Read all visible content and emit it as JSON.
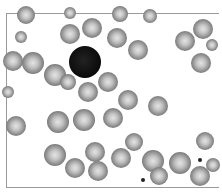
{
  "image": {
    "subject": "blood smear micrograph",
    "palette": {
      "background": "#ffffff",
      "cell_rim": "#6a6a6a",
      "cell_center": "#e4e4e4",
      "nucleus": "#0a0a0a",
      "frame": "#9a9a9a"
    }
  },
  "cells": [
    {
      "x": 26,
      "y": 15,
      "r": 9
    },
    {
      "x": 70,
      "y": 13,
      "r": 6
    },
    {
      "x": 92,
      "y": 28,
      "r": 10
    },
    {
      "x": 120,
      "y": 14,
      "r": 8
    },
    {
      "x": 150,
      "y": 16,
      "r": 7
    },
    {
      "x": 21,
      "y": 37,
      "r": 6
    },
    {
      "x": 70,
      "y": 34,
      "r": 10
    },
    {
      "x": 117,
      "y": 38,
      "r": 10
    },
    {
      "x": 138,
      "y": 50,
      "r": 10
    },
    {
      "x": 185,
      "y": 41,
      "r": 10
    },
    {
      "x": 203,
      "y": 29,
      "r": 10
    },
    {
      "x": 212,
      "y": 45,
      "r": 6
    },
    {
      "x": 13,
      "y": 61,
      "r": 10
    },
    {
      "x": 33,
      "y": 63,
      "r": 11
    },
    {
      "x": 55,
      "y": 75,
      "r": 11
    },
    {
      "x": 68,
      "y": 82,
      "r": 8
    },
    {
      "x": 88,
      "y": 92,
      "r": 10
    },
    {
      "x": 108,
      "y": 82,
      "r": 10
    },
    {
      "x": 201,
      "y": 63,
      "r": 10
    },
    {
      "x": 8,
      "y": 92,
      "r": 6
    },
    {
      "x": 128,
      "y": 100,
      "r": 10
    },
    {
      "x": 158,
      "y": 106,
      "r": 10
    },
    {
      "x": 16,
      "y": 126,
      "r": 10
    },
    {
      "x": 58,
      "y": 122,
      "r": 11
    },
    {
      "x": 84,
      "y": 120,
      "r": 11
    },
    {
      "x": 113,
      "y": 118,
      "r": 10
    },
    {
      "x": 134,
      "y": 142,
      "r": 9
    },
    {
      "x": 205,
      "y": 141,
      "r": 9
    },
    {
      "x": 55,
      "y": 155,
      "r": 11
    },
    {
      "x": 95,
      "y": 152,
      "r": 10
    },
    {
      "x": 75,
      "y": 168,
      "r": 10
    },
    {
      "x": 98,
      "y": 171,
      "r": 10
    },
    {
      "x": 121,
      "y": 158,
      "r": 10
    },
    {
      "x": 153,
      "y": 161,
      "r": 11
    },
    {
      "x": 180,
      "y": 163,
      "r": 11
    },
    {
      "x": 159,
      "y": 176,
      "r": 9
    },
    {
      "x": 200,
      "y": 176,
      "r": 10
    },
    {
      "x": 213,
      "y": 165,
      "r": 7
    }
  ],
  "nucleus": {
    "x": 85,
    "y": 62,
    "r": 16
  },
  "dots": [
    {
      "x": 200,
      "y": 160,
      "r": 2
    },
    {
      "x": 143,
      "y": 180,
      "r": 2
    }
  ]
}
